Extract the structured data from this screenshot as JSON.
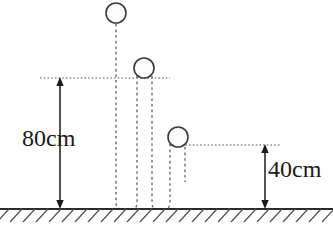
{
  "figure": {
    "background_color": "#ffffff",
    "ink_color": "#333333",
    "text_color": "#1a1a1a"
  },
  "measurements": [
    {
      "id": "drop-height",
      "label": "80cm",
      "value": 80,
      "unit": "cm",
      "from_y_px": 78,
      "to_y_px": 208,
      "arrow_x_px": 60
    },
    {
      "id": "rebound-height",
      "label": "40cm",
      "value": 40,
      "unit": "cm",
      "from_y_px": 145,
      "to_y_px": 208,
      "arrow_x_px": 265
    }
  ],
  "balls": [
    {
      "id": "ball-initial",
      "cx": 116,
      "cy": 13,
      "r": 10,
      "fill": "#fbfbfb",
      "stroke": "#3b3b3b"
    },
    {
      "id": "ball-rebound-1",
      "cx": 144,
      "cy": 68,
      "r": 10,
      "fill": "#fbfbfb",
      "stroke": "#3b3b3b"
    },
    {
      "id": "ball-rebound-2",
      "cx": 178,
      "cy": 137,
      "r": 10,
      "fill": "#fbfbfb",
      "stroke": "#3b3b3b"
    }
  ],
  "reference_lines": [
    {
      "id": "line-80cm",
      "y": 78,
      "x1": 40,
      "x2": 170,
      "style": "dotted"
    },
    {
      "id": "line-40cm",
      "y": 145,
      "x1": 178,
      "x2": 280,
      "style": "dotted"
    }
  ],
  "trajectories": [
    {
      "id": "path-drop",
      "x": 116,
      "y1": 25,
      "y2": 208
    },
    {
      "id": "path-up-1",
      "x": 136,
      "y1": 76,
      "y2": 208
    },
    {
      "id": "path-down-1",
      "x": 152,
      "y1": 76,
      "y2": 208
    },
    {
      "id": "path-up-2",
      "x": 170,
      "y1": 143,
      "y2": 208
    },
    {
      "id": "path-down-2",
      "x": 185,
      "y1": 146,
      "y2": 180
    }
  ],
  "ground": {
    "id": "ground-line",
    "y": 209,
    "x1": 0,
    "x2": 333,
    "hatch_count": 25,
    "hatch_spacing": 13,
    "hatch_depth": 12
  }
}
